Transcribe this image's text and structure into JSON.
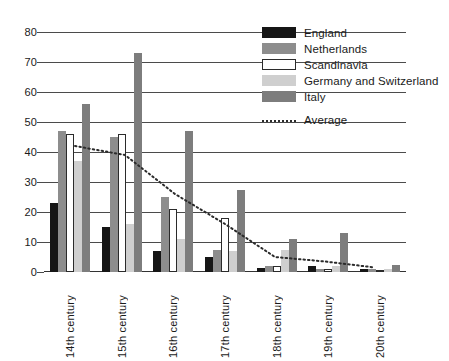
{
  "chart_data": {
    "type": "bar",
    "title": "",
    "subtitle": "",
    "xlabel": "",
    "ylabel": "",
    "ylim": [
      0,
      80
    ],
    "ytick_step": 10,
    "yticks": [
      0,
      10,
      20,
      30,
      40,
      50,
      60,
      70,
      80
    ],
    "grid": true,
    "legend_position": "top-right",
    "categories": [
      "14th century",
      "15th century",
      "16th century",
      "17th century",
      "18th century",
      "19th century",
      "20th century"
    ],
    "series": [
      {
        "name": "England",
        "color": "#161616",
        "values": [
          23,
          15,
          7,
          5,
          1.5,
          2,
          1
        ]
      },
      {
        "name": "Netherlands",
        "color": "#8d8d8d",
        "values": [
          47,
          45,
          25,
          7.5,
          2,
          1,
          1
        ]
      },
      {
        "name": "Scandinavia",
        "color": "#ffffff",
        "values": [
          46,
          46,
          21,
          18,
          2,
          1,
          0.8
        ]
      },
      {
        "name": "Germany and Switzerland",
        "color": "#cfcfcf",
        "values": [
          37,
          16,
          11,
          7,
          7.5,
          2,
          1
        ]
      },
      {
        "name": "Italy",
        "color": "#7d7d7d",
        "values": [
          56,
          73,
          47,
          27.5,
          11,
          13,
          2.5
        ]
      }
    ],
    "overlay_series": [
      {
        "name": "Average",
        "style": "dotted-line",
        "color": "#2b2b2b",
        "values": [
          42,
          39,
          26,
          16,
          5,
          3.5,
          1.5
        ]
      }
    ]
  },
  "legend": {
    "entries": [
      {
        "label": "England",
        "swatch": "england"
      },
      {
        "label": "Netherlands",
        "swatch": "netherlands"
      },
      {
        "label": "Scandinavia",
        "swatch": "scandinavia"
      },
      {
        "label": "Germany and Switzerland",
        "swatch": "germany"
      },
      {
        "label": "Italy",
        "swatch": "italy"
      },
      {
        "label": "Average",
        "swatch": "average"
      }
    ]
  }
}
